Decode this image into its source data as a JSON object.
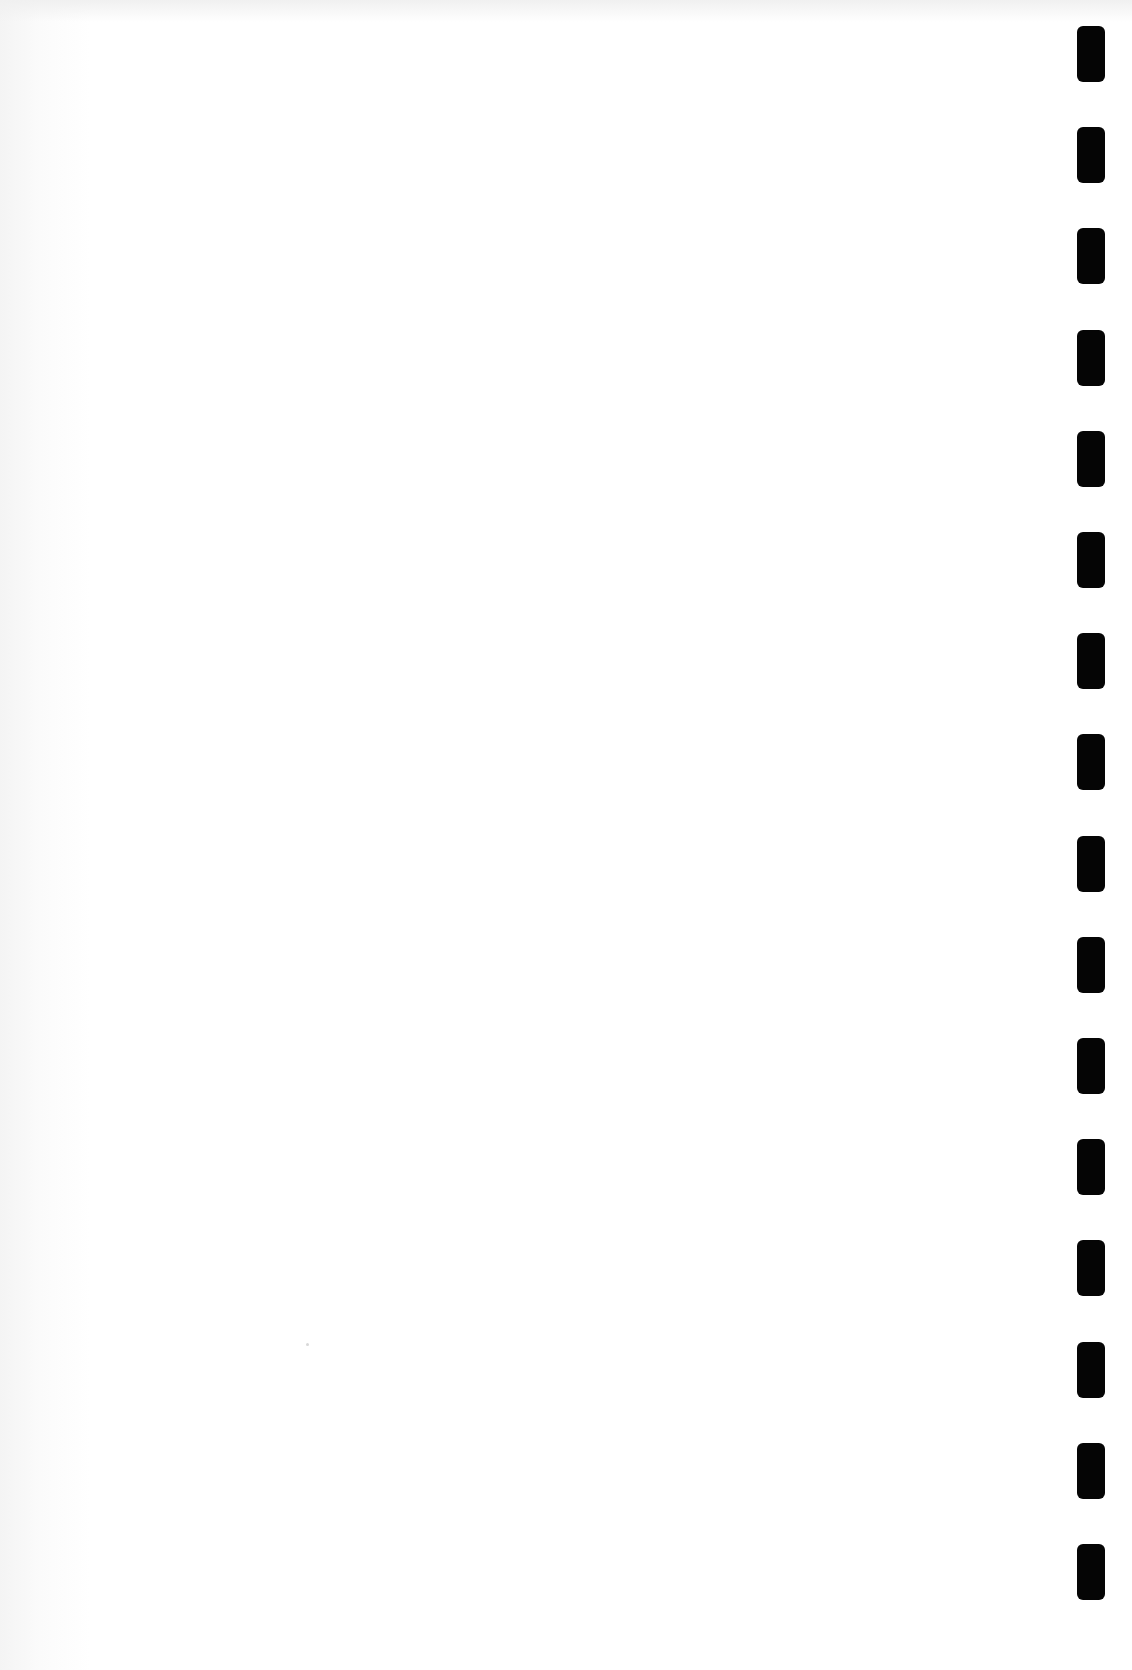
{
  "page": {
    "type": "blank scanned page",
    "background_color": "#ffffff",
    "text": ""
  },
  "binding_holes": {
    "count": 16,
    "color": "#050505",
    "side": "right"
  }
}
